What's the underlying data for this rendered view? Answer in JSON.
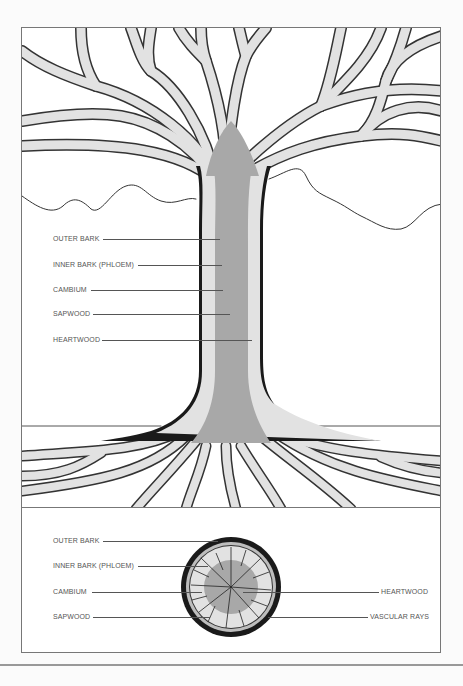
{
  "diagram": {
    "colors": {
      "bark": "#1a1a1a",
      "sapwood": "#e2e2e2",
      "heartwood": "#a8a8a8",
      "background": "#ffffff",
      "leader_line": "#555555"
    },
    "trunk_labels": [
      {
        "text": "OUTER BARK",
        "y": 238
      },
      {
        "text": "INNER BARK (PHLOEM)",
        "y": 264
      },
      {
        "text": "CAMBIUM",
        "y": 289
      },
      {
        "text": "SAPWOOD",
        "y": 313
      },
      {
        "text": "HEARTWOOD",
        "y": 339
      }
    ],
    "cross_section_left_labels": [
      {
        "text": "OUTER BARK",
        "y": 541
      },
      {
        "text": "INNER BARK (PHLOEM)",
        "y": 566
      },
      {
        "text": "CAMBIUM",
        "y": 592
      },
      {
        "text": "SAPWOOD",
        "y": 617
      }
    ],
    "cross_section_right_labels": [
      {
        "text": "HEARTWOOD",
        "y": 592
      },
      {
        "text": "VASCULAR RAYS",
        "y": 617
      }
    ]
  }
}
